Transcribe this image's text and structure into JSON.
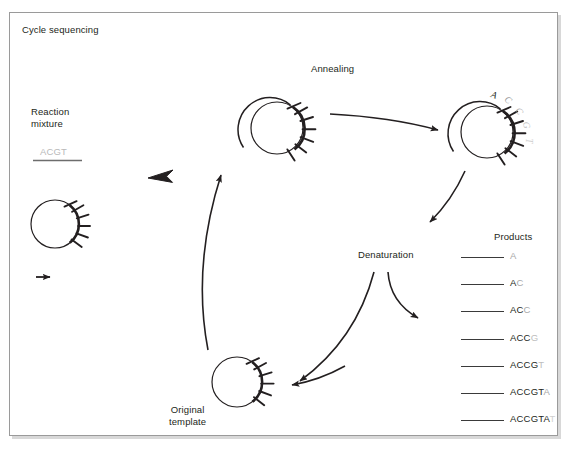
{
  "figure": {
    "title": "Cycle sequencing",
    "width": 574,
    "height": 456,
    "background": "#ffffff",
    "border_color": "#9a9a9a",
    "ink_color": "#231f20"
  },
  "labels": {
    "annealing": "Annealing",
    "denaturation": "Denaturation",
    "products": "Products",
    "reaction_mixture_line1": "Reaction",
    "reaction_mixture_line2": "mixture",
    "original_template_line1": "Original",
    "original_template_line2": "template",
    "nucleotides": "ACGT"
  },
  "colors": {
    "faded_nucleotides": "#b9b9b9",
    "product_line": "#3a3a3a",
    "terminator_light": "#b5b5b5"
  },
  "growing_strand_bases": [
    {
      "letter": "A",
      "color": "#231f20"
    },
    {
      "letter": "C",
      "color": "#9c9c9c"
    },
    {
      "letter": "C",
      "color": "#b0b0b0"
    },
    {
      "letter": "G",
      "color": "#c0c0c0"
    },
    {
      "letter": "T",
      "color": "#cfcfcf"
    }
  ],
  "products": [
    {
      "body": "",
      "terminator": "A",
      "terminator_shade": "tail2"
    },
    {
      "body": "A",
      "terminator": "C",
      "terminator_shade": "tail2"
    },
    {
      "body": "AC",
      "terminator": "C",
      "terminator_shade": "tail2"
    },
    {
      "body": "ACC",
      "terminator": "G",
      "terminator_shade": "tail3"
    },
    {
      "body": "ACCG",
      "terminator": "T",
      "terminator_shade": "tail3"
    },
    {
      "body": "ACCGT",
      "terminator": "A",
      "terminator_shade": "tail2"
    },
    {
      "body": "ACCGTA",
      "terminator": "T",
      "terminator_shade": "tail4"
    }
  ],
  "icons": {
    "thick_arrow": "thick-left-arrow-icon",
    "small_arrow": "small-right-arrow-icon",
    "annealing_arrow": "curved-right-arrow-icon",
    "denature_in_arrow": "curved-down-left-arrow-icon",
    "denature_out_arrow": "curved-down-right-arrow-icon",
    "recycle_arrow": "curved-down-left-long-arrow-icon",
    "template_return_arrow": "curved-left-arrow-icon",
    "cycle_up_arrow": "curved-up-right-arrow-icon"
  }
}
